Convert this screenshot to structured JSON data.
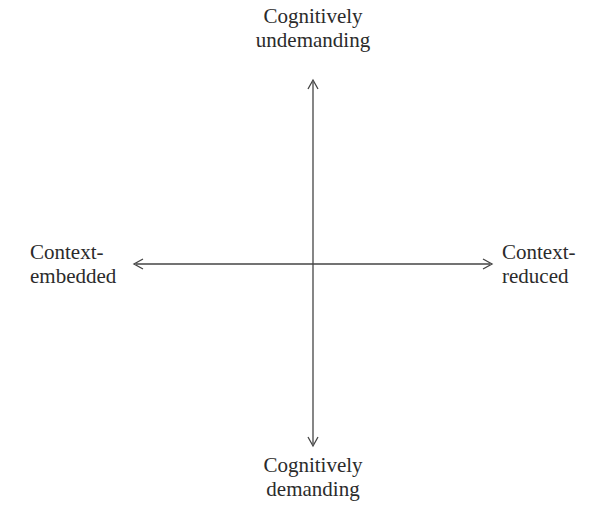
{
  "diagram": {
    "type": "quadrant-axes",
    "center": {
      "x": 313,
      "y": 264
    },
    "line_color": "#444444",
    "axes": {
      "vertical": {
        "top": {
          "line1": "Cognitively",
          "line2": "undemanding"
        },
        "bottom": {
          "line1": "Cognitively",
          "line2": "demanding"
        }
      },
      "horizontal": {
        "left": {
          "line1": "Context-",
          "line2": "embedded"
        },
        "right": {
          "line1": "Context-",
          "line2": "reduced"
        }
      }
    },
    "arrows": {
      "up": "arrow-up-icon",
      "down": "arrow-down-icon",
      "left": "arrow-left-icon",
      "right": "arrow-right-icon"
    }
  }
}
